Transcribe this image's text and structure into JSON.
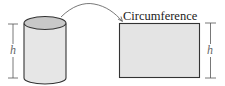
{
  "diagram": {
    "cylinder": {
      "height_label": "h",
      "fill_side": "#e6e6e6",
      "fill_top": "#c8c8c8",
      "stroke": "#333333"
    },
    "arrow": {
      "direction": "cylinder-to-rectangle"
    },
    "rectangle": {
      "top_label": "Circumference",
      "height_label": "h",
      "fill": "#e4e4e4",
      "stroke": "#333333"
    },
    "colors": {
      "line": "#444444",
      "text": "#222222",
      "h_label": "#666666"
    }
  }
}
